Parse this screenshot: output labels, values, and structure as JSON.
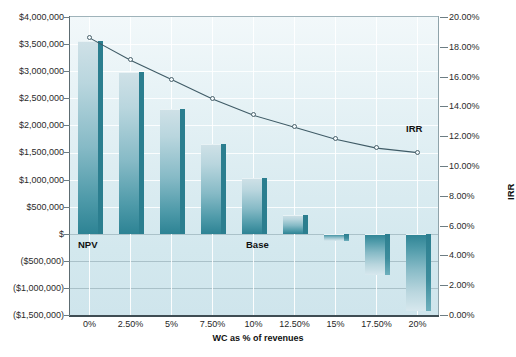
{
  "chart_data": {
    "type": "bar",
    "title": "",
    "xlabel": "WC as % of revenues",
    "ylabel": "NPV",
    "y2label": "IRR",
    "categories": [
      "0%",
      "2.50%",
      "5%",
      "7.50%",
      "10%",
      "12.50%",
      "15%",
      "17.50%",
      "20%"
    ],
    "grid": true,
    "legend_position": "inline-annotations",
    "ylim": [
      -1500000,
      4000000
    ],
    "y2lim": [
      0,
      0.2
    ],
    "ytick_labels": [
      "$4,000,000",
      "$3,500,000",
      "$3,000,000",
      "$2,500,000",
      "$2,000,000",
      "$1,500,000",
      "$1,000,000",
      "$500,000",
      "$",
      "($500,000)",
      "($1,000,000)",
      "($1,500,000)"
    ],
    "y2tick_labels": [
      "20.00%",
      "18.00%",
      "16.00%",
      "14.00%",
      "12.00%",
      "10.00%",
      "8.00%",
      "6.00%",
      "4.00%",
      "2.00%",
      "0.00%"
    ],
    "series": [
      {
        "name": "NPV",
        "type": "bar",
        "axis": "left",
        "values": [
          3560000,
          2990000,
          2310000,
          1660000,
          1030000,
          350000,
          -140000,
          -760000,
          -1430000
        ]
      },
      {
        "name": "IRR",
        "type": "line",
        "axis": "right",
        "values": [
          0.186,
          0.171,
          0.158,
          0.145,
          0.134,
          0.126,
          0.118,
          0.112,
          0.109
        ]
      }
    ],
    "annotations": [
      {
        "text": "NPV",
        "at_category": "0%"
      },
      {
        "text": "Base",
        "at_category": "10%"
      },
      {
        "text": "IRR",
        "at_category": "17.50%"
      }
    ],
    "colors": {
      "bar_face_light": "#cfe1e7",
      "bar_face_dark": "#2d8394",
      "bar_side": "#2b7e8f",
      "line": "#3f5b66",
      "marker_fill": "#f4fbfd",
      "plot_background": "#dbecf1",
      "grid": "#ffffff",
      "axis": "#3f4d53",
      "text": "#1f1f1f"
    }
  }
}
